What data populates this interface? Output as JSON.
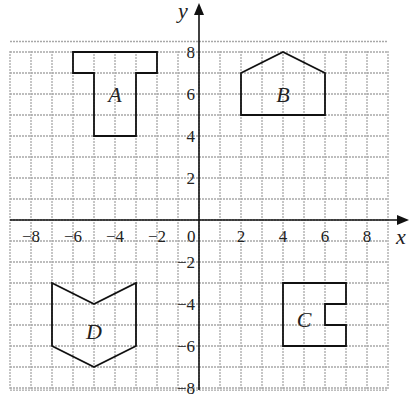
{
  "axes": {
    "x_label": "x",
    "y_label": "y",
    "range": [
      -9,
      9
    ],
    "x_ticks": [
      "-8",
      "-6",
      "-4",
      "-2",
      "0",
      "2",
      "4",
      "6",
      "8"
    ],
    "y_ticks": [
      "8",
      "6",
      "4",
      "2",
      "-2",
      "-4",
      "-6",
      "-8"
    ]
  },
  "shapes": [
    {
      "label": "A",
      "points": [
        [
          -6,
          8
        ],
        [
          -2,
          8
        ],
        [
          -2,
          7
        ],
        [
          -3,
          7
        ],
        [
          -3,
          4
        ],
        [
          -5,
          4
        ],
        [
          -5,
          7
        ],
        [
          -6,
          7
        ]
      ],
      "label_pos": [
        -4,
        6
      ]
    },
    {
      "label": "B",
      "points": [
        [
          2,
          5
        ],
        [
          2,
          7
        ],
        [
          4,
          8
        ],
        [
          6,
          7
        ],
        [
          6,
          5
        ]
      ],
      "label_pos": [
        4,
        6
      ]
    },
    {
      "label": "C",
      "points": [
        [
          4,
          -3
        ],
        [
          7,
          -3
        ],
        [
          7,
          -4
        ],
        [
          6,
          -4
        ],
        [
          6,
          -5
        ],
        [
          7,
          -5
        ],
        [
          7,
          -6
        ],
        [
          4,
          -6
        ]
      ],
      "label_pos": [
        5,
        -4.7
      ]
    },
    {
      "label": "D",
      "points": [
        [
          -7,
          -3
        ],
        [
          -5,
          -4
        ],
        [
          -3,
          -3
        ],
        [
          -3,
          -6
        ],
        [
          -5,
          -7
        ],
        [
          -7,
          -6
        ]
      ],
      "label_pos": [
        -5,
        -5.3
      ]
    }
  ]
}
